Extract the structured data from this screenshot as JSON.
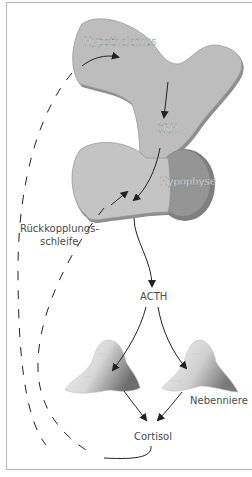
{
  "diagram": {
    "type": "hormone-feedback-axis",
    "nodes": {
      "hypothalamus": "Hypothalamus",
      "crh": "CRH",
      "hypophyse": "Hypophyse",
      "acth": "ACTH",
      "nebenniere": "Nebenniere",
      "cortisol": "Cortisol",
      "feedback_line1": "Rückkopplungs-",
      "feedback_line2": "schleife"
    },
    "edges": [
      {
        "from": "Hypothalamus",
        "to": "CRH",
        "style": "solid"
      },
      {
        "from": "CRH",
        "to": "Hypophyse",
        "style": "solid"
      },
      {
        "from": "Hypophyse",
        "to": "ACTH",
        "style": "solid"
      },
      {
        "from": "ACTH",
        "to": "Nebenniere (left)",
        "style": "solid"
      },
      {
        "from": "ACTH",
        "to": "Nebenniere (right)",
        "style": "solid"
      },
      {
        "from": "Nebenniere (left)",
        "to": "Cortisol",
        "style": "solid"
      },
      {
        "from": "Nebenniere (right)",
        "to": "Cortisol",
        "style": "solid"
      },
      {
        "from": "Cortisol",
        "to": "Hypophyse",
        "style": "dashed",
        "label": "Rückkopplungsschleife"
      },
      {
        "from": "Cortisol",
        "to": "Hypothalamus",
        "style": "dashed"
      }
    ],
    "colors": {
      "organ_fill": "#bdbdbd",
      "organ_shadow": "#8e8e8e",
      "posterior_fill": "#8f8f8f",
      "arrow": "#222222",
      "frame": "#b8b8b8"
    }
  }
}
